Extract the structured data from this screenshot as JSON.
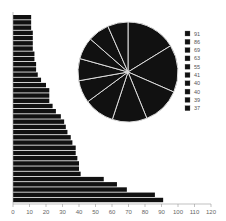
{
  "chart_data": {
    "type": "bar",
    "orientation": "horizontal",
    "title": "",
    "xlabel": "",
    "ylabel": "",
    "xlim": [
      0,
      120
    ],
    "x_ticks": [
      0,
      10,
      20,
      30,
      40,
      50,
      60,
      70,
      80,
      90,
      100,
      110,
      120
    ],
    "grid": false,
    "bar_color": "#111111",
    "values": [
      11,
      11,
      11,
      12,
      12,
      12,
      12,
      13,
      13,
      14,
      14,
      15,
      17,
      20,
      22,
      22,
      22,
      24,
      26,
      29,
      31,
      32,
      33,
      35,
      36,
      38,
      38,
      39,
      40,
      40,
      41,
      55,
      63,
      69,
      86,
      91
    ],
    "inset_pie": {
      "type": "pie",
      "values": [
        91,
        86,
        69,
        63,
        55,
        41,
        40,
        40,
        39,
        37
      ],
      "legend": [
        "91",
        "86",
        "69",
        "63",
        "55",
        "41",
        "40",
        "40",
        "39",
        "37"
      ],
      "slice_color": "#111111",
      "separator_color": "#dddddd",
      "legend_position": "right"
    }
  }
}
